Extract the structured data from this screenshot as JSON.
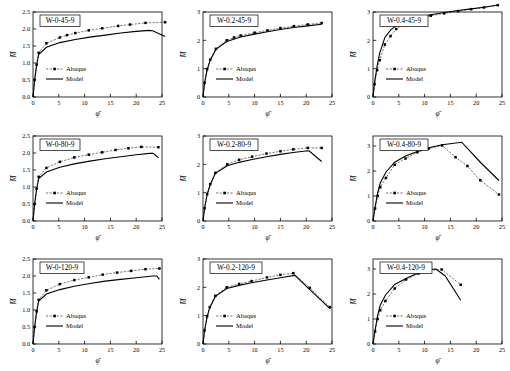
{
  "figure": {
    "rows": 3,
    "cols": 3,
    "series_names": [
      "Abaqus",
      "Model"
    ],
    "xlabel": "φ̄",
    "ylabel": "M̄",
    "colors": {
      "line": "#000000",
      "marker": "#000000",
      "axis": "#000000",
      "box": "#000000"
    }
  },
  "chart_data": [
    {
      "type": "line",
      "title": "W-0-45-9",
      "xlabel": "φ̄",
      "ylabel": "M̄",
      "xlim": [
        0,
        25
      ],
      "ylim": [
        0,
        2.5
      ],
      "xticks": [
        0,
        5,
        10,
        15,
        20,
        25
      ],
      "yticks": [
        "0.0",
        "0.5",
        "1.0",
        "1.5",
        "2.0",
        "2.5"
      ],
      "grid": false,
      "legend": [
        "Abaqus",
        "Model"
      ],
      "legend_position": "lower-left",
      "series": [
        {
          "name": "Abaqus",
          "x": [
            0,
            0.3,
            0.7,
            1.1,
            2.6,
            5.2,
            6.6,
            8.2,
            10.8,
            13.4,
            16.5,
            18.8,
            21.8,
            25.6
          ],
          "y": [
            0,
            0.5,
            0.95,
            1.3,
            1.58,
            1.75,
            1.82,
            1.88,
            1.96,
            2.02,
            2.09,
            2.13,
            2.18,
            2.2
          ]
        },
        {
          "name": "Model",
          "x": [
            0,
            0.3,
            0.7,
            1.1,
            2.6,
            5.2,
            8.2,
            11,
            14,
            17,
            20,
            22.5,
            23.2,
            25.6
          ],
          "y": [
            0,
            0.48,
            0.93,
            1.25,
            1.46,
            1.6,
            1.69,
            1.76,
            1.82,
            1.88,
            1.93,
            1.96,
            1.95,
            1.78
          ]
        }
      ]
    },
    {
      "type": "line",
      "title": "W-0.2-45-9",
      "xlabel": "φ̄",
      "ylabel": "M̄",
      "xlim": [
        0,
        25
      ],
      "ylim": [
        0,
        3
      ],
      "xticks": [
        0,
        5,
        10,
        15,
        20,
        25
      ],
      "yticks": [
        "0",
        "1",
        "2",
        "3"
      ],
      "grid": false,
      "legend": [
        "Abaqus",
        "Model"
      ],
      "legend_position": "lower-left",
      "series": [
        {
          "name": "Abaqus",
          "x": [
            0,
            0.3,
            0.8,
            1.4,
            2.5,
            4.6,
            6,
            7.3,
            10,
            12.5,
            15,
            17.6,
            20.3,
            23
          ],
          "y": [
            0,
            0.5,
            0.98,
            1.32,
            1.7,
            2.0,
            2.1,
            2.17,
            2.27,
            2.35,
            2.43,
            2.5,
            2.56,
            2.61
          ]
        },
        {
          "name": "Model",
          "x": [
            0,
            0.3,
            0.8,
            1.4,
            2.5,
            4.6,
            7.3,
            10,
            12.5,
            15,
            17.6,
            20.3,
            23
          ],
          "y": [
            0,
            0.49,
            0.96,
            1.3,
            1.68,
            1.96,
            2.12,
            2.22,
            2.3,
            2.38,
            2.45,
            2.51,
            2.57
          ]
        }
      ]
    },
    {
      "type": "line",
      "title": "W-0.4-45-9",
      "xlabel": "φ̄",
      "ylabel": "M̄",
      "xlim": [
        0,
        25
      ],
      "ylim": [
        0,
        3
      ],
      "xticks": [
        0,
        5,
        10,
        15,
        20,
        25
      ],
      "yticks": [
        "0",
        "1",
        "2",
        "3"
      ],
      "grid": false,
      "legend": [
        "Abaqus",
        "Model"
      ],
      "legend_position": "lower-left",
      "series": [
        {
          "name": "Abaqus",
          "x": [
            0,
            0.3,
            0.8,
            1.3,
            2.3,
            3.4,
            4.5,
            6.5,
            8.8,
            11.2,
            13.8,
            16.5,
            19,
            21.5,
            24.2
          ],
          "y": [
            0,
            0.45,
            0.95,
            1.3,
            1.85,
            2.15,
            2.4,
            2.62,
            2.77,
            2.87,
            2.95,
            3.03,
            3.1,
            3.16,
            3.24
          ]
        },
        {
          "name": "Model",
          "x": [
            0,
            0.3,
            0.8,
            1.3,
            2.3,
            3.4,
            4.5,
            6.5,
            8.8,
            11.2,
            13.8,
            16.5,
            19,
            21.5,
            24.2
          ],
          "y": [
            0,
            0.5,
            1.1,
            1.55,
            2.1,
            2.36,
            2.52,
            2.7,
            2.82,
            2.9,
            2.98,
            3.05,
            3.11,
            3.17,
            3.25
          ]
        }
      ]
    },
    {
      "type": "line",
      "title": "W-0-80-9",
      "xlabel": "φ̄",
      "ylabel": "M̄",
      "xlim": [
        0,
        25
      ],
      "ylim": [
        0,
        2.5
      ],
      "xticks": [
        0,
        5,
        10,
        15,
        20,
        25
      ],
      "yticks": [
        "0.0",
        "0.5",
        "1.0",
        "1.5",
        "2.0",
        "2.5"
      ],
      "grid": false,
      "legend": [
        "Abaqus",
        "Model"
      ],
      "legend_position": "lower-left",
      "series": [
        {
          "name": "Abaqus",
          "x": [
            0,
            0.3,
            0.7,
            1.1,
            2.6,
            5.2,
            8,
            10.8,
            13.4,
            16,
            18.5,
            21,
            24.3
          ],
          "y": [
            0,
            0.5,
            0.95,
            1.3,
            1.56,
            1.74,
            1.87,
            1.95,
            2.02,
            2.09,
            2.14,
            2.18,
            2.17
          ]
        },
        {
          "name": "Model",
          "x": [
            0,
            0.3,
            0.7,
            1.1,
            2.6,
            5.2,
            8,
            11,
            14,
            17,
            20,
            22.6,
            23.3,
            24.3
          ],
          "y": [
            0,
            0.48,
            0.93,
            1.25,
            1.44,
            1.58,
            1.68,
            1.76,
            1.83,
            1.89,
            1.95,
            1.99,
            1.99,
            1.86
          ]
        }
      ]
    },
    {
      "type": "line",
      "title": "W-0.2-80-9",
      "xlabel": "φ̄",
      "ylabel": "M̄",
      "xlim": [
        0,
        25
      ],
      "ylim": [
        0,
        3
      ],
      "xticks": [
        0,
        5,
        10,
        15,
        20,
        25
      ],
      "yticks": [
        "0",
        "1",
        "2",
        "3"
      ],
      "grid": false,
      "legend": [
        "Abaqus",
        "Model"
      ],
      "legend_position": "lower-left",
      "series": [
        {
          "name": "Abaqus",
          "x": [
            0,
            0.3,
            0.8,
            1.4,
            2.4,
            4.7,
            7,
            9.5,
            12.3,
            15,
            17.5,
            20.3,
            23
          ],
          "y": [
            0,
            0.45,
            0.95,
            1.3,
            1.7,
            2.0,
            2.16,
            2.27,
            2.38,
            2.46,
            2.53,
            2.58,
            2.58
          ]
        },
        {
          "name": "Model",
          "x": [
            0,
            0.3,
            0.8,
            1.4,
            2.4,
            4.7,
            7,
            9.5,
            12.3,
            15,
            17.5,
            20.3,
            20.6,
            23
          ],
          "y": [
            0,
            0.44,
            0.93,
            1.28,
            1.68,
            1.95,
            2.07,
            2.17,
            2.27,
            2.35,
            2.42,
            2.48,
            2.47,
            2.1
          ]
        }
      ]
    },
    {
      "type": "line",
      "title": "W-0.4-80-9",
      "xlabel": "φ̄",
      "ylabel": "M̄",
      "xlim": [
        0,
        25
      ],
      "ylim": [
        0,
        3.4
      ],
      "xticks": [
        0,
        5,
        10,
        15,
        20,
        25
      ],
      "yticks": [
        "0",
        "1",
        "2",
        "3"
      ],
      "grid": false,
      "legend": [
        "Abaqus",
        "Model"
      ],
      "legend_position": "lower-left",
      "series": [
        {
          "name": "Abaqus",
          "x": [
            0,
            0.4,
            0.9,
            1.4,
            2.5,
            4.2,
            6.3,
            8.6,
            10.8,
            13.4,
            16,
            18.3,
            20.8,
            24.4
          ],
          "y": [
            0,
            0.5,
            1.0,
            1.35,
            1.72,
            2.25,
            2.5,
            2.75,
            2.9,
            3.02,
            2.55,
            2.2,
            1.63,
            1.06
          ]
        },
        {
          "name": "Model",
          "x": [
            0,
            0.4,
            0.9,
            1.4,
            2.5,
            4.2,
            6.3,
            8.6,
            10.8,
            13.4,
            17.2,
            20.8,
            24.4
          ],
          "y": [
            0,
            0.55,
            1.12,
            1.52,
            1.95,
            2.35,
            2.6,
            2.78,
            2.93,
            3.05,
            3.15,
            2.35,
            1.62
          ]
        }
      ]
    },
    {
      "type": "line",
      "title": "W-0-120-9",
      "xlabel": "φ̄",
      "ylabel": "M̄",
      "xlim": [
        0,
        25
      ],
      "ylim": [
        0,
        2.5
      ],
      "xticks": [
        0,
        5,
        10,
        15,
        20,
        25
      ],
      "yticks": [
        "0.0",
        "0.5",
        "1.0",
        "1.5",
        "2.0",
        "2.5"
      ],
      "grid": false,
      "legend": [
        "Abaqus",
        "Model"
      ],
      "legend_position": "lower-left",
      "series": [
        {
          "name": "Abaqus",
          "x": [
            0,
            0.3,
            0.7,
            1.1,
            2.6,
            5.2,
            8,
            10.8,
            13.5,
            16.3,
            19,
            21.8,
            24.5
          ],
          "y": [
            0,
            0.5,
            0.96,
            1.3,
            1.58,
            1.76,
            1.88,
            1.96,
            2.04,
            2.1,
            2.15,
            2.2,
            2.22
          ]
        },
        {
          "name": "Model",
          "x": [
            0,
            0.3,
            0.7,
            1.1,
            2.6,
            5.2,
            8,
            11,
            14,
            17,
            20,
            23.2,
            24,
            24.5
          ],
          "y": [
            0,
            0.48,
            0.94,
            1.26,
            1.47,
            1.6,
            1.7,
            1.78,
            1.85,
            1.9,
            1.95,
            2.0,
            2.0,
            1.9
          ]
        }
      ]
    },
    {
      "type": "line",
      "title": "W-0.2-120-9",
      "xlabel": "φ̄",
      "ylabel": "M̄",
      "xlim": [
        0,
        25
      ],
      "ylim": [
        0,
        3
      ],
      "xticks": [
        0,
        5,
        10,
        15,
        20,
        25
      ],
      "yticks": [
        "0",
        "1",
        "2",
        "3"
      ],
      "grid": false,
      "legend": [
        "Abaqus",
        "Model"
      ],
      "legend_position": "lower-left",
      "series": [
        {
          "name": "Abaqus",
          "x": [
            0,
            0.3,
            0.8,
            1.3,
            2.4,
            4.6,
            7,
            9.4,
            12.4,
            15,
            17.5,
            20.7,
            24.6
          ],
          "y": [
            0,
            0.48,
            0.98,
            1.3,
            1.7,
            2.0,
            2.12,
            2.22,
            2.35,
            2.44,
            2.5,
            1.98,
            1.3
          ]
        },
        {
          "name": "Model",
          "x": [
            0,
            0.3,
            0.8,
            1.3,
            2.4,
            4.6,
            7,
            9.4,
            12.4,
            15,
            17.8,
            20.7,
            24.6
          ],
          "y": [
            0,
            0.47,
            0.96,
            1.28,
            1.68,
            1.96,
            2.07,
            2.16,
            2.26,
            2.34,
            2.42,
            1.92,
            1.25
          ]
        }
      ]
    },
    {
      "type": "line",
      "title": "W-0.4-120-9",
      "xlabel": "φ̄",
      "ylabel": "M̄",
      "xlim": [
        0,
        25
      ],
      "ylim": [
        0,
        3.4
      ],
      "xticks": [
        0,
        5,
        10,
        15,
        20,
        25
      ],
      "yticks": [
        "0",
        "1",
        "2",
        "3"
      ],
      "grid": false,
      "legend": [
        "Abaqus",
        "Model"
      ],
      "legend_position": "lower-left",
      "series": [
        {
          "name": "Abaqus",
          "x": [
            0,
            0.4,
            0.9,
            1.4,
            2.4,
            4.2,
            6.4,
            8.8,
            11,
            13.3,
            17
          ],
          "y": [
            0,
            0.5,
            1.0,
            1.35,
            1.72,
            2.22,
            2.58,
            2.82,
            2.95,
            2.98,
            2.37
          ]
        },
        {
          "name": "Model",
          "x": [
            0,
            0.4,
            0.9,
            1.4,
            2.4,
            4.2,
            6.4,
            8.8,
            11,
            12.2,
            14,
            17
          ],
          "y": [
            0,
            0.55,
            1.15,
            1.55,
            1.95,
            2.38,
            2.62,
            2.85,
            2.98,
            3.0,
            2.72,
            1.75
          ]
        }
      ]
    }
  ]
}
